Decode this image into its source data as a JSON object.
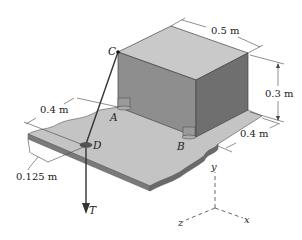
{
  "figure": {
    "type": "statics-3d-diagram",
    "dimensions": {
      "box_width": "0.5 m",
      "box_height": "0.3 m",
      "box_depth": "0.4 m",
      "plate_offset": "0.4 m",
      "cable_offset": "0.125 m"
    },
    "points": {
      "C": "C",
      "A": "A",
      "B": "B",
      "D": "D"
    },
    "force": {
      "label": "T"
    },
    "axes": {
      "x": "x",
      "y": "y",
      "z": "z"
    },
    "colors": {
      "box_top": "#c9c9c9",
      "box_front": "#8e8e8e",
      "box_side": "#6f6f6f",
      "plate_top": "#c4c4c4",
      "plate_edge": "#7a7a7a",
      "line": "#333333"
    }
  }
}
